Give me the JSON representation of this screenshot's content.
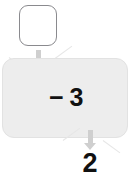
{
  "diagram": {
    "type": "data-flow",
    "title": "",
    "input_block": {
      "label": "",
      "shape": "rounded-square",
      "fill": "#ffffff",
      "border": "#8a8a8e"
    },
    "input_arrow": {
      "icon": "arrow-down-icon",
      "color": "#cfcfcf",
      "direction": "down"
    },
    "operator_block": {
      "label": "− 3",
      "operator": "−",
      "operand": "3",
      "shape": "rounded-rectangle",
      "fill": "#ededed",
      "border": "#e2e2e2"
    },
    "output_arrow": {
      "icon": "arrow-down-icon",
      "color": "#cfcfcf",
      "direction": "down"
    },
    "output_value": "2",
    "connector_marks": {
      "icon": "chevron-wing-icon",
      "color": "#e6e6e6",
      "count": 4
    }
  }
}
